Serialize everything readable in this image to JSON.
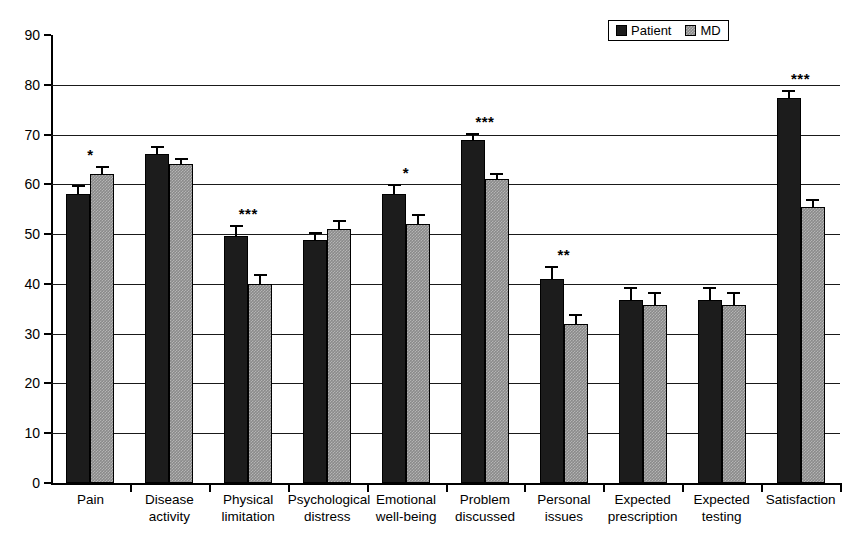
{
  "chart_data": {
    "type": "bar",
    "title": "",
    "subtitle": "",
    "xlabel": "",
    "ylabel": "",
    "ylim": [
      0,
      90
    ],
    "ytick_step": 10,
    "ytick_labels": [
      "0",
      "10",
      "20",
      "30",
      "40",
      "50",
      "60",
      "70",
      "80",
      "90"
    ],
    "grid": true,
    "grid_axis": "y",
    "legend_position": "top-right",
    "categories": [
      "Pain",
      "Disease activity",
      "Physical limitation",
      "Psychological distress",
      "Emotional well-being",
      "Problem discussed",
      "Personal issues",
      "Expected prescription",
      "Expected testing",
      "Satisfaction"
    ],
    "series": [
      {
        "name": "Patient",
        "color": "#1c1c1c",
        "values": [
          58.0,
          66.0,
          49.7,
          48.8,
          58.0,
          69.0,
          41.0,
          36.7,
          36.7,
          77.3
        ],
        "errors": [
          1.8,
          1.7,
          2.2,
          1.7,
          2.0,
          1.3,
          2.6,
          2.6,
          2.6,
          1.7
        ]
      },
      {
        "name": "MD",
        "color": "#8a8a8a",
        "values": [
          62.0,
          64.0,
          40.0,
          51.0,
          52.0,
          61.0,
          32.0,
          35.7,
          35.7,
          55.5
        ],
        "errors": [
          1.7,
          1.3,
          1.9,
          1.9,
          2.0,
          1.3,
          1.9,
          2.6,
          2.6,
          1.5
        ]
      }
    ],
    "significance": [
      {
        "category": "Pain",
        "marker": "*"
      },
      {
        "category": "Disease activity",
        "marker": ""
      },
      {
        "category": "Physical limitation",
        "marker": "***"
      },
      {
        "category": "Psychological distress",
        "marker": ""
      },
      {
        "category": "Emotional well-being",
        "marker": "*"
      },
      {
        "category": "Problem discussed",
        "marker": "***"
      },
      {
        "category": "Personal issues",
        "marker": "**"
      },
      {
        "category": "Expected prescription",
        "marker": ""
      },
      {
        "category": "Expected testing",
        "marker": ""
      },
      {
        "category": "Satisfaction",
        "marker": "***"
      }
    ]
  },
  "legend": {
    "entries": [
      {
        "label": "Patient",
        "swatch": "patient-swatch-icon"
      },
      {
        "label": "MD",
        "swatch": "md-swatch-icon"
      }
    ]
  }
}
